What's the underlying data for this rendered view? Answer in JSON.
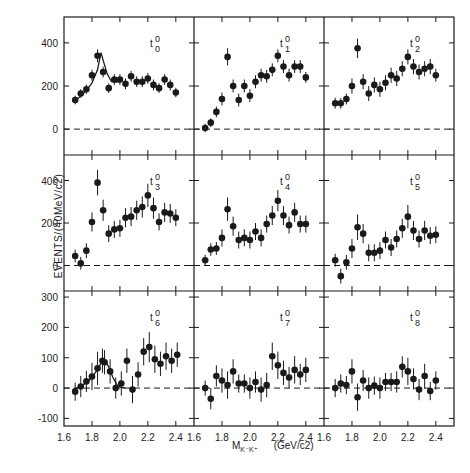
{
  "chart_data": {
    "type": "scatter",
    "title": "",
    "xlabel": "M_{K-K+}",
    "xlabel_unit": "(GeV/c2)",
    "ylabel": "EVENTS/(40MeV/c2)",
    "xlim": [
      1.6,
      2.53
    ],
    "x_ticks": [
      1.6,
      1.8,
      2.0,
      2.2,
      2.4
    ],
    "x_tick_labels": [
      "1.6",
      "1.8",
      "2.0",
      "2.2",
      "2.4"
    ],
    "layout": {
      "rows": 3,
      "cols": 3,
      "grid": false,
      "zero_line": "dashed"
    },
    "rows": [
      {
        "ylim": [
          -120,
          520
        ],
        "y_ticks": [
          0,
          200,
          400
        ],
        "y_tick_labels": [
          "0",
          "200",
          "400"
        ]
      },
      {
        "ylim": [
          -120,
          520
        ],
        "y_ticks": [
          0,
          200,
          400
        ],
        "y_tick_labels": [
          "0",
          "200",
          "400"
        ]
      },
      {
        "ylim": [
          -125,
          320
        ],
        "y_ticks": [
          -100,
          0,
          100,
          200,
          300
        ],
        "y_tick_labels": [
          "-100",
          "0",
          "100",
          "200",
          "300"
        ]
      }
    ],
    "x": [
      1.68,
      1.72,
      1.76,
      1.8,
      1.84,
      1.88,
      1.92,
      1.96,
      2.0,
      2.04,
      2.08,
      2.12,
      2.16,
      2.2,
      2.24,
      2.28,
      2.32,
      2.36,
      2.4,
      2.44
    ],
    "panels": [
      {
        "label": "t",
        "sup": "0",
        "sub": "0",
        "row": 0,
        "col": 0,
        "values": [
          135,
          165,
          185,
          250,
          340,
          265,
          190,
          230,
          230,
          210,
          245,
          220,
          220,
          235,
          205,
          190,
          230,
          205,
          170
        ],
        "errors": [
          20,
          20,
          22,
          25,
          30,
          25,
          22,
          25,
          25,
          25,
          25,
          25,
          25,
          25,
          25,
          22,
          25,
          25,
          22
        ],
        "fit_curve": [
          [
            1.68,
            130
          ],
          [
            1.72,
            155
          ],
          [
            1.76,
            180
          ],
          [
            1.8,
            215
          ],
          [
            1.84,
            275
          ],
          [
            1.865,
            355
          ],
          [
            1.88,
            320
          ],
          [
            1.91,
            255
          ],
          [
            1.94,
            220
          ],
          [
            1.98,
            218
          ],
          [
            2.0,
            220
          ]
        ]
      },
      {
        "label": "t",
        "sup": "0",
        "sub": "1",
        "row": 0,
        "col": 1,
        "values": [
          5,
          30,
          80,
          140,
          335,
          200,
          135,
          200,
          155,
          220,
          250,
          245,
          275,
          340,
          290,
          250,
          290,
          290,
          240
        ],
        "errors": [
          20,
          20,
          25,
          30,
          40,
          30,
          30,
          30,
          30,
          30,
          30,
          30,
          30,
          30,
          30,
          30,
          30,
          30,
          25
        ]
      },
      {
        "label": "t",
        "sup": "0",
        "sub": "2",
        "row": 0,
        "col": 2,
        "values": [
          120,
          120,
          140,
          200,
          375,
          220,
          165,
          205,
          185,
          215,
          250,
          235,
          280,
          335,
          290,
          265,
          280,
          290,
          250
        ],
        "errors": [
          25,
          25,
          25,
          35,
          45,
          35,
          35,
          35,
          35,
          35,
          35,
          35,
          35,
          35,
          35,
          35,
          35,
          35,
          30
        ]
      },
      {
        "label": "t",
        "sup": "0",
        "sub": "3",
        "row": 1,
        "col": 0,
        "values": [
          45,
          10,
          70,
          205,
          390,
          260,
          150,
          170,
          175,
          225,
          230,
          260,
          275,
          330,
          270,
          205,
          250,
          245,
          225
        ],
        "errors": [
          30,
          30,
          35,
          45,
          60,
          50,
          40,
          40,
          40,
          45,
          45,
          45,
          50,
          55,
          50,
          40,
          45,
          45,
          40
        ]
      },
      {
        "label": "t",
        "sup": "0",
        "sub": "4",
        "row": 1,
        "col": 1,
        "values": [
          25,
          75,
          80,
          130,
          265,
          185,
          120,
          130,
          120,
          160,
          130,
          195,
          235,
          305,
          235,
          190,
          250,
          195,
          195
        ],
        "errors": [
          25,
          30,
          30,
          40,
          55,
          45,
          40,
          40,
          40,
          40,
          40,
          40,
          45,
          50,
          45,
          40,
          45,
          40,
          40
        ]
      },
      {
        "label": "t",
        "sup": "0",
        "sub": "5",
        "row": 1,
        "col": 2,
        "values": [
          25,
          -50,
          15,
          80,
          180,
          150,
          60,
          60,
          70,
          120,
          85,
          125,
          175,
          230,
          165,
          125,
          165,
          140,
          145
        ],
        "errors": [
          30,
          35,
          35,
          45,
          60,
          45,
          40,
          40,
          40,
          40,
          40,
          40,
          45,
          55,
          45,
          40,
          45,
          40,
          40
        ]
      },
      {
        "label": "t",
        "sup": "0",
        "sub": "6",
        "row": 2,
        "col": 0,
        "values": [
          -12,
          5,
          22,
          38,
          65,
          90,
          85,
          55,
          0,
          15,
          90,
          -5,
          45,
          120,
          135,
          95,
          80,
          105,
          90,
          110
        ],
        "x_override": [
          1.68,
          1.72,
          1.76,
          1.8,
          1.84,
          1.875,
          1.89,
          1.93,
          1.97,
          2.01,
          2.05,
          2.09,
          2.13,
          2.17,
          2.21,
          2.25,
          2.29,
          2.33,
          2.37,
          2.41
        ],
        "errors": [
          30,
          35,
          35,
          45,
          55,
          40,
          40,
          40,
          35,
          40,
          40,
          45,
          40,
          45,
          50,
          45,
          40,
          45,
          40,
          40
        ],
        "fit_curve": [
          [
            1.66,
            -5
          ],
          [
            1.72,
            5
          ],
          [
            1.78,
            25
          ],
          [
            1.83,
            55
          ],
          [
            1.87,
            85
          ],
          [
            1.89,
            92
          ],
          [
            1.92,
            70
          ],
          [
            1.95,
            35
          ],
          [
            1.98,
            10
          ],
          [
            2.01,
            2
          ],
          [
            2.04,
            0
          ]
        ]
      },
      {
        "label": "t",
        "sup": "0",
        "sub": "7",
        "row": 2,
        "col": 1,
        "values": [
          0,
          -35,
          40,
          25,
          10,
          55,
          15,
          15,
          0,
          20,
          -5,
          10,
          105,
          75,
          50,
          35,
          60,
          45,
          60
        ],
        "errors": [
          25,
          35,
          35,
          40,
          45,
          40,
          30,
          30,
          35,
          35,
          40,
          40,
          45,
          45,
          40,
          35,
          45,
          35,
          40
        ]
      },
      {
        "label": "t",
        "sup": "0",
        "sub": "8",
        "row": 2,
        "col": 2,
        "values": [
          0,
          15,
          10,
          55,
          -30,
          25,
          0,
          8,
          0,
          20,
          20,
          20,
          70,
          55,
          30,
          -5,
          40,
          -10,
          25
        ],
        "errors": [
          30,
          30,
          30,
          40,
          45,
          35,
          35,
          30,
          35,
          30,
          30,
          35,
          35,
          45,
          35,
          35,
          40,
          30,
          30
        ]
      }
    ]
  }
}
